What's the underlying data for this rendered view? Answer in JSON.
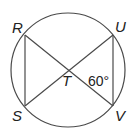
{
  "diagram": {
    "type": "circle-with-inscribed-chords",
    "colors": {
      "stroke": "#4a4a4a",
      "text": "#222222",
      "background": "#ffffff"
    },
    "circle": {
      "cx": 68,
      "cy": 70,
      "r": 57
    },
    "points": {
      "R": {
        "label": "R",
        "x": 25,
        "y": 35
      },
      "U": {
        "label": "U",
        "x": 113,
        "y": 35
      },
      "S": {
        "label": "S",
        "x": 25,
        "y": 106
      },
      "V": {
        "label": "V",
        "x": 113,
        "y": 106
      },
      "T": {
        "label": "T",
        "x": 69,
        "y": 70
      }
    },
    "segments": [
      "RV",
      "SU",
      "RS",
      "UV"
    ],
    "angle_label": {
      "text": "60°",
      "at": "T",
      "between": [
        "TV",
        "TU"
      ]
    }
  }
}
